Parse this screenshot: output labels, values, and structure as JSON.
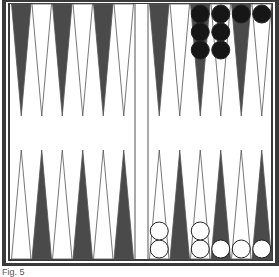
{
  "caption": "Fig. 5",
  "colors": {
    "frame": "#3a3a3a",
    "dark_point": "#4a4a4a",
    "light_point": "#ffffff",
    "point_outline": "#555555",
    "black_checker": "#161616",
    "white_checker": "#ffffff",
    "board_bg": "#ffffff"
  },
  "board": {
    "top_row_points": [
      "dark",
      "light",
      "dark",
      "light",
      "dark",
      "light",
      "dark",
      "light",
      "dark",
      "light",
      "dark",
      "light"
    ],
    "bottom_row_points": [
      "light",
      "dark",
      "light",
      "dark",
      "light",
      "dark",
      "light",
      "dark",
      "light",
      "dark",
      "light",
      "dark"
    ],
    "black_checkers_top": [
      {
        "column": 9,
        "count": 3
      },
      {
        "column": 10,
        "count": 3
      },
      {
        "column": 11,
        "count": 1
      },
      {
        "column": 12,
        "count": 1
      }
    ],
    "white_checkers_bottom": [
      {
        "column": 7,
        "count": 2
      },
      {
        "column": 9,
        "count": 2
      },
      {
        "column": 10,
        "count": 1
      },
      {
        "column": 11,
        "count": 1
      },
      {
        "column": 12,
        "count": 1
      }
    ]
  }
}
